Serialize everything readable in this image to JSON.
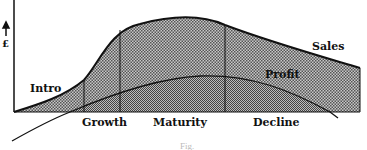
{
  "diagram": {
    "y_axis_label": "£",
    "curves": [
      {
        "name": "Sales"
      },
      {
        "name": "Profit"
      }
    ],
    "stages": [
      "Intro",
      "Growth",
      "Maturity",
      "Decline"
    ],
    "caption": "Fig."
  },
  "colors": {
    "line": "#111111",
    "fill_dark": "#8a8a8a",
    "fill_light": "#b5b5b5"
  }
}
